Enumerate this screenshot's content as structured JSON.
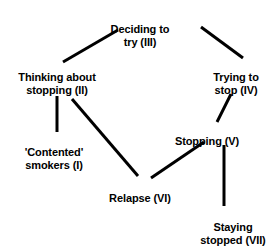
{
  "diagram": {
    "background_color": "#ffffff",
    "line_color": "#000000",
    "text_color": "#000000",
    "nodes": [
      {
        "id": "contented",
        "label": "'Contented'\nsmokers (I)",
        "stage": "I"
      },
      {
        "id": "thinking",
        "label": "Thinking about\nstopping (II)",
        "stage": "II"
      },
      {
        "id": "deciding",
        "label": "Deciding to\ntry (III)",
        "stage": "III"
      },
      {
        "id": "trying",
        "label": "Trying to\nstop (IV)",
        "stage": "IV"
      },
      {
        "id": "stopping",
        "label": "Stopping (V)",
        "stage": "V"
      },
      {
        "id": "relapse",
        "label": "Relapse (VI)",
        "stage": "VI"
      },
      {
        "id": "staying",
        "label": "Staying\nstopped (VII)",
        "stage": "VII"
      }
    ],
    "edges": [
      {
        "from": "thinking",
        "to": "deciding",
        "x1": 63,
        "y1": 62,
        "x2": 118,
        "y2": 30
      },
      {
        "from": "deciding",
        "to": "trying",
        "x1": 201,
        "y1": 27,
        "x2": 243,
        "y2": 58
      },
      {
        "from": "contented",
        "to": "thinking",
        "x1": 57,
        "y1": 96,
        "x2": 57,
        "y2": 132
      },
      {
        "from": "thinking",
        "to": "relapse",
        "x1": 72,
        "y1": 99,
        "x2": 138,
        "y2": 176
      },
      {
        "from": "trying",
        "to": "stopping",
        "x1": 231,
        "y1": 94,
        "x2": 217,
        "y2": 122
      },
      {
        "from": "relapse",
        "to": "stopping",
        "x1": 151,
        "y1": 178,
        "x2": 204,
        "y2": 142
      },
      {
        "from": "stopping",
        "to": "staying",
        "x1": 224,
        "y1": 145,
        "x2": 224,
        "y2": 206
      }
    ]
  }
}
